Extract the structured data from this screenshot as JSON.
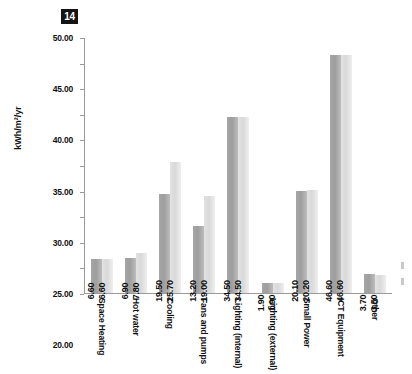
{
  "badge": {
    "label": "14"
  },
  "chart_data": {
    "type": "bar",
    "title": "",
    "xlabel": "",
    "ylabel": "kWh/m²/yr",
    "ylim": [
      0,
      50
    ],
    "ytick_step": 5,
    "grid": false,
    "legend": "none",
    "yticks": [
      "0.00",
      "5.00",
      "10.00",
      "15.00",
      "20.00",
      "25.00",
      "30.00",
      "35.00",
      "40.00",
      "45.00",
      "50.00"
    ],
    "categories": [
      "Space Heating",
      "Hot water",
      "Cooling",
      "Fans and pumps",
      "Lighting (internal)",
      "Lighting (external)",
      "Small Power",
      "ICT Equipment",
      "Other"
    ],
    "series": [
      {
        "name": "series-1",
        "color": "#a6a6a6",
        "values": [
          6.6,
          6.9,
          19.5,
          13.2,
          34.5,
          1.9,
          20.1,
          46.6,
          3.7
        ],
        "labels": [
          "6.60",
          "6.90",
          "19.50",
          "13.20",
          "34.50",
          "1.90",
          "20.10",
          "46.60",
          "3.70"
        ]
      },
      {
        "name": "series-2",
        "color": "#d9d9d9",
        "values": [
          6.6,
          7.8,
          25.7,
          19.0,
          34.5,
          1.9,
          20.2,
          46.6,
          3.5
        ],
        "labels": [
          "6.60",
          "7.80",
          "25.70",
          "19.00",
          "34.50",
          "1.90",
          "20.20",
          "46.60",
          "3.50"
        ]
      }
    ]
  }
}
